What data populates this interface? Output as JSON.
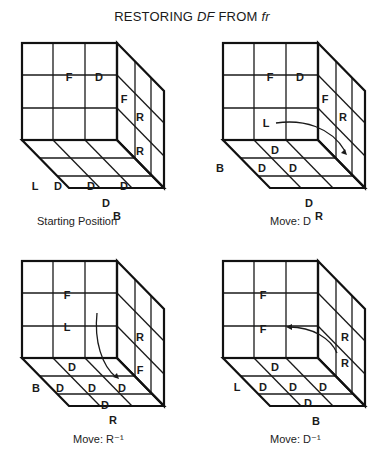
{
  "title": {
    "parts": [
      {
        "text": "RESTORING ",
        "italic": false
      },
      {
        "text": "DF",
        "italic": true
      },
      {
        "text": " FROM ",
        "italic": false
      },
      {
        "text": "fr",
        "italic": true
      }
    ]
  },
  "colors": {
    "ink": "#1a1a1a",
    "background": "#ffffff"
  },
  "cubes": [
    {
      "id": "starting-position",
      "origin": [
        22,
        43
      ],
      "caption": "Starting Position",
      "caption_pos": [
        37,
        215
      ],
      "labels": [
        {
          "text": "F",
          "x": 47,
          "y": 38
        },
        {
          "text": "D",
          "x": 77,
          "y": 38
        },
        {
          "text": "F",
          "x": 102,
          "y": 60
        },
        {
          "text": "R",
          "x": 118,
          "y": 78
        },
        {
          "text": "R",
          "x": 118,
          "y": 112
        },
        {
          "text": "L",
          "x": 13,
          "y": 147
        },
        {
          "text": "D",
          "x": 36,
          "y": 147
        },
        {
          "text": "D",
          "x": 69,
          "y": 147
        },
        {
          "text": "D",
          "x": 102,
          "y": 147
        },
        {
          "text": "D",
          "x": 84,
          "y": 164
        },
        {
          "text": "B",
          "x": 95,
          "y": 177
        }
      ],
      "arrow": null
    },
    {
      "id": "move-d",
      "origin": [
        223,
        43
      ],
      "caption": "Move: D",
      "caption_pos": [
        270,
        215
      ],
      "labels": [
        {
          "text": "F",
          "x": 47,
          "y": 38
        },
        {
          "text": "D",
          "x": 77,
          "y": 38
        },
        {
          "text": "F",
          "x": 102,
          "y": 60
        },
        {
          "text": "R",
          "x": 120,
          "y": 78
        },
        {
          "text": "L",
          "x": 43,
          "y": 84
        },
        {
          "text": "D",
          "x": 52,
          "y": 111
        },
        {
          "text": "B",
          "x": -3,
          "y": 129
        },
        {
          "text": "D",
          "x": 39,
          "y": 129
        },
        {
          "text": "D",
          "x": 70,
          "y": 129
        },
        {
          "text": "D",
          "x": 86,
          "y": 164
        },
        {
          "text": "R",
          "x": 96,
          "y": 177
        }
      ],
      "arrow": {
        "path": "M 53 80 C 80 76, 108 84, 122 108",
        "head": [
          124,
          112
        ],
        "head_dir": "down-right"
      }
    },
    {
      "id": "move-r-inverse",
      "origin": [
        22,
        261
      ],
      "caption": "Move: R⁻¹",
      "caption_pos": [
        73,
        433
      ],
      "labels": [
        {
          "text": "F",
          "x": 45,
          "y": 38
        },
        {
          "text": "L",
          "x": 45,
          "y": 70
        },
        {
          "text": "R",
          "x": 118,
          "y": 80
        },
        {
          "text": "F",
          "x": 118,
          "y": 113
        },
        {
          "text": "D",
          "x": 50,
          "y": 110
        },
        {
          "text": "B",
          "x": 14,
          "y": 131
        },
        {
          "text": "D",
          "x": 38,
          "y": 131
        },
        {
          "text": "D",
          "x": 70,
          "y": 131
        },
        {
          "text": "D",
          "x": 100,
          "y": 131
        },
        {
          "text": "D",
          "x": 83,
          "y": 148
        },
        {
          "text": "R",
          "x": 91,
          "y": 163
        }
      ],
      "arrow": {
        "path": "M 75 52 C 72 80, 80 105, 94 116",
        "head": [
          97,
          118
        ],
        "head_dir": "down-right"
      }
    },
    {
      "id": "move-d-inverse",
      "origin": [
        223,
        261
      ],
      "caption": "Move: D⁻¹",
      "caption_pos": [
        270,
        433
      ],
      "labels": [
        {
          "text": "F",
          "x": 40,
          "y": 38
        },
        {
          "text": "F",
          "x": 40,
          "y": 72
        },
        {
          "text": "R",
          "x": 122,
          "y": 80
        },
        {
          "text": "R",
          "x": 122,
          "y": 106
        },
        {
          "text": "D",
          "x": 52,
          "y": 110
        },
        {
          "text": "L",
          "x": 14,
          "y": 130
        },
        {
          "text": "D",
          "x": 40,
          "y": 130
        },
        {
          "text": "D",
          "x": 70,
          "y": 130
        },
        {
          "text": "D",
          "x": 100,
          "y": 130
        },
        {
          "text": "D",
          "x": 85,
          "y": 146
        },
        {
          "text": "B",
          "x": 93,
          "y": 164
        }
      ],
      "arrow": {
        "path": "M 114 92 C 108 78, 90 66, 66 66",
        "head": [
          63,
          66
        ],
        "head_dir": "left"
      }
    }
  ]
}
